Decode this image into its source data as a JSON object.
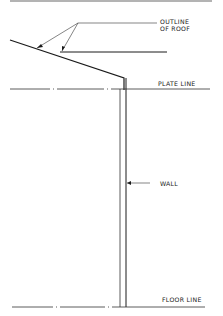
{
  "diagram": {
    "type": "architectural-section-sketch",
    "labels": {
      "roof_outline_line1": "OUTLINE",
      "roof_outline_line2": "OF ROOF",
      "plate_line": "PLATE LINE",
      "wall": "WALL",
      "floor_line": "FLOOR LINE"
    },
    "colors": {
      "line": "#1a1a1a",
      "light_line": "#555555",
      "top_bar": "#9a9a9a",
      "background": "#ffffff"
    }
  }
}
